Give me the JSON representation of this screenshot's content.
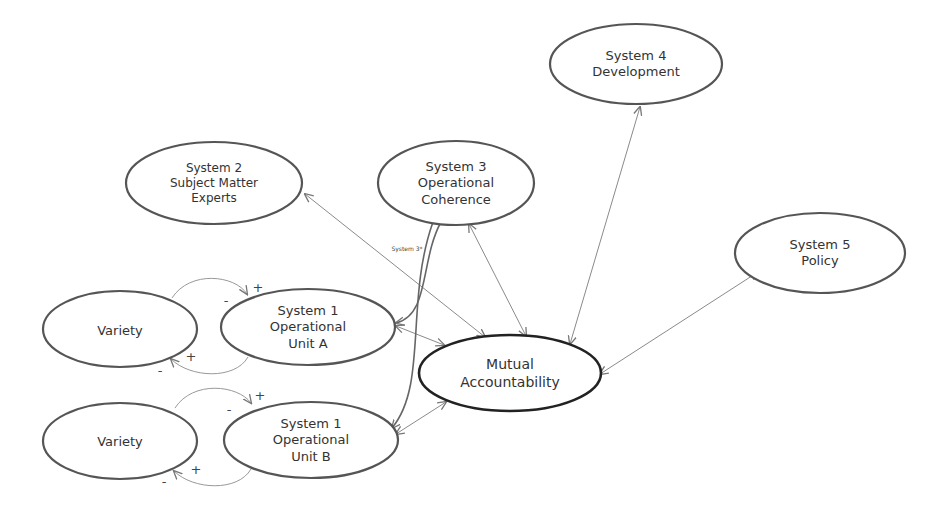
{
  "diagram": {
    "nodes": [
      {
        "id": "s4",
        "lines": [
          "System 4",
          "Development"
        ]
      },
      {
        "id": "s2",
        "lines": [
          "System 2",
          "Subject Matter",
          "Experts"
        ]
      },
      {
        "id": "s3",
        "lines": [
          "System 3",
          "Operational",
          "Coherence"
        ]
      },
      {
        "id": "s5",
        "lines": [
          "System 5",
          "Policy"
        ]
      },
      {
        "id": "varA",
        "lines": [
          "Variety"
        ]
      },
      {
        "id": "s1a",
        "lines": [
          "System 1",
          "Operational",
          "Unit A"
        ]
      },
      {
        "id": "mutual",
        "lines": [
          "Mutual",
          "Accountability"
        ]
      },
      {
        "id": "varB",
        "lines": [
          "Variety"
        ]
      },
      {
        "id": "s1b",
        "lines": [
          "System 1",
          "Operational",
          "Unit B"
        ]
      }
    ],
    "edge_labels": {
      "s3star": "System 3*"
    },
    "signs": {
      "plus": "+",
      "minus": "-"
    },
    "colors": {
      "node_stroke": "#555555",
      "mutual_stroke": "#222222",
      "edge": "#888888",
      "text": "#333333"
    }
  }
}
